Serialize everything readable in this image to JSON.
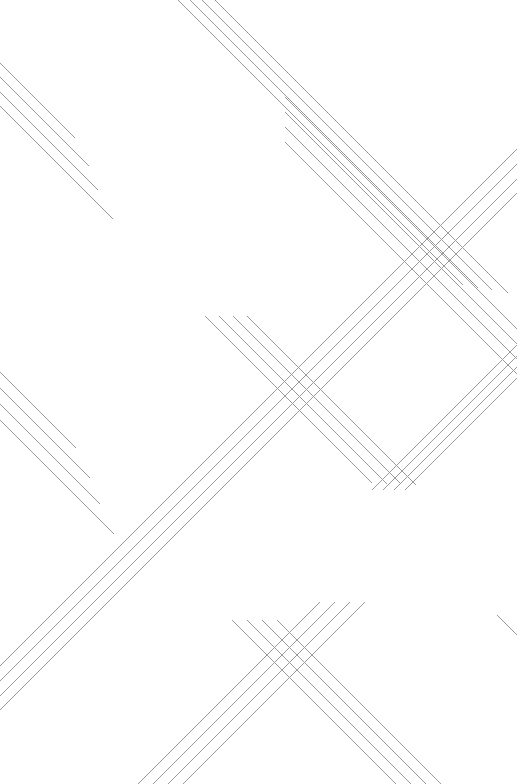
{
  "artwork": {
    "title": "Abstract Diagonal Line Composition",
    "width": 517,
    "height": 784,
    "background_color": "#ffffff",
    "line_color": "#9a9a9a",
    "line_width": 1,
    "lines_per_bundle": 4,
    "bundle_spacing": 14,
    "angle_degrees": 45,
    "description": "Minimal line-art: bundles of four parallel thin gray diagonal lines at plus and minus forty-five degrees on a white field, crossing to form X intersections.",
    "bundles": [
      {
        "name": "top-left-descending",
        "direction": "down-right",
        "lines": [
          {
            "x1": 0,
            "y1": 63,
            "x2": 75,
            "y2": 138
          },
          {
            "x1": 0,
            "y1": 77,
            "x2": 89,
            "y2": 166
          },
          {
            "x1": 0,
            "y1": 92,
            "x2": 98,
            "y2": 190
          },
          {
            "x1": 0,
            "y1": 106,
            "x2": 113,
            "y2": 219
          }
        ]
      },
      {
        "name": "top-center-descending",
        "direction": "down-right",
        "lines": [
          {
            "x1": 178,
            "y1": 0,
            "x2": 463,
            "y2": 285
          },
          {
            "x1": 190,
            "y1": 0,
            "x2": 478,
            "y2": 288
          },
          {
            "x1": 202,
            "y1": 0,
            "x2": 492,
            "y2": 290
          },
          {
            "x1": 215,
            "y1": 0,
            "x2": 508,
            "y2": 293
          }
        ]
      },
      {
        "name": "center-descending",
        "direction": "down-right",
        "lines": [
          {
            "x1": 205,
            "y1": 316,
            "x2": 372,
            "y2": 483
          },
          {
            "x1": 219,
            "y1": 316,
            "x2": 387,
            "y2": 484
          },
          {
            "x1": 233,
            "y1": 316,
            "x2": 401,
            "y2": 484
          },
          {
            "x1": 247,
            "y1": 316,
            "x2": 416,
            "y2": 485
          }
        ]
      },
      {
        "name": "mid-left-descending",
        "direction": "down-right",
        "lines": [
          {
            "x1": 0,
            "y1": 372,
            "x2": 76,
            "y2": 448
          },
          {
            "x1": 0,
            "y1": 388,
            "x2": 90,
            "y2": 478
          },
          {
            "x1": 0,
            "y1": 404,
            "x2": 100,
            "y2": 504
          },
          {
            "x1": 0,
            "y1": 420,
            "x2": 114,
            "y2": 534
          }
        ]
      },
      {
        "name": "bottom-center-descending",
        "direction": "down-right",
        "lines": [
          {
            "x1": 232,
            "y1": 620,
            "x2": 396,
            "y2": 784
          },
          {
            "x1": 247,
            "y1": 620,
            "x2": 411,
            "y2": 784
          },
          {
            "x1": 262,
            "y1": 620,
            "x2": 426,
            "y2": 784
          },
          {
            "x1": 277,
            "y1": 620,
            "x2": 441,
            "y2": 784
          }
        ]
      },
      {
        "name": "right-edge-descending-fragment",
        "direction": "down-right",
        "lines": [
          {
            "x1": 497,
            "y1": 615,
            "x2": 517,
            "y2": 635
          }
        ]
      },
      {
        "name": "top-right-ascending",
        "direction": "up-right",
        "lines": [
          {
            "x1": 285,
            "y1": 97,
            "x2": 517,
            "y2": 329
          },
          {
            "x1": 285,
            "y1": 112,
            "x2": 517,
            "y2": 344
          },
          {
            "x1": 285,
            "y1": 127,
            "x2": 517,
            "y2": 359
          },
          {
            "x1": 285,
            "y1": 142,
            "x2": 517,
            "y2": 374
          }
        ],
        "note": "drawn as reflected ascending strokes"
      },
      {
        "name": "mid-right-ascending",
        "direction": "up-right",
        "lines": [
          {
            "x1": 372,
            "y1": 490,
            "x2": 517,
            "y2": 345
          },
          {
            "x1": 383,
            "y1": 490,
            "x2": 517,
            "y2": 356
          },
          {
            "x1": 394,
            "y1": 490,
            "x2": 517,
            "y2": 367
          },
          {
            "x1": 405,
            "y1": 490,
            "x2": 517,
            "y2": 378
          }
        ]
      },
      {
        "name": "long-ascending-diagonal",
        "direction": "up-right",
        "lines": [
          {
            "x1": 0,
            "y1": 710,
            "x2": 517,
            "y2": 193
          },
          {
            "x1": 0,
            "y1": 696,
            "x2": 517,
            "y2": 179
          },
          {
            "x1": 0,
            "y1": 681,
            "x2": 517,
            "y2": 164
          },
          {
            "x1": 0,
            "y1": 666,
            "x2": 517,
            "y2": 149
          }
        ]
      },
      {
        "name": "bottom-left-ascending",
        "direction": "up-right",
        "lines": [
          {
            "x1": 138,
            "y1": 784,
            "x2": 320,
            "y2": 602
          },
          {
            "x1": 153,
            "y1": 784,
            "x2": 335,
            "y2": 602
          },
          {
            "x1": 168,
            "y1": 784,
            "x2": 350,
            "y2": 602
          },
          {
            "x1": 183,
            "y1": 784,
            "x2": 365,
            "y2": 602
          }
        ]
      }
    ]
  }
}
